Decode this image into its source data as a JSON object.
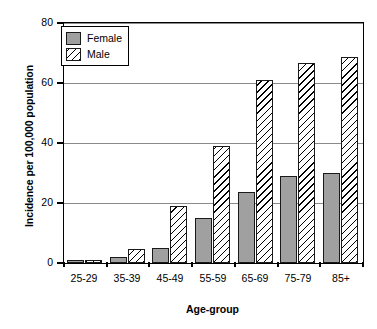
{
  "chart_data": {
    "type": "bar",
    "title": "",
    "xlabel": "Age-group",
    "ylabel": "Incidence per 100,000 population",
    "categories": [
      "25-29",
      "35-39",
      "45-49",
      "55-59",
      "65-69",
      "75-79",
      "85+"
    ],
    "series": [
      {
        "name": "Female",
        "color": "#a0a0a0",
        "fill": "solid-gray",
        "values": [
          1,
          2,
          5,
          15,
          23.5,
          29,
          30
        ]
      },
      {
        "name": "Male",
        "color": "#ffffff",
        "fill": "diagonal-hatch",
        "values": [
          1,
          4.5,
          19,
          39,
          61,
          66.5,
          68.5
        ]
      }
    ],
    "ylim": [
      0,
      80
    ],
    "yticks": [
      0,
      20,
      40,
      60,
      80
    ],
    "ytick_labels": [
      "0",
      "20",
      "40",
      "60",
      "80"
    ],
    "grid": true,
    "grid_axis": "y",
    "legend_position": "top-left",
    "legend_entries": [
      "Female",
      "Male"
    ]
  },
  "axes": {
    "y_title": "Incidence per 100,000 population",
    "x_title": "Age-group"
  },
  "legend": {
    "female_label": "Female",
    "male_label": "Male"
  }
}
